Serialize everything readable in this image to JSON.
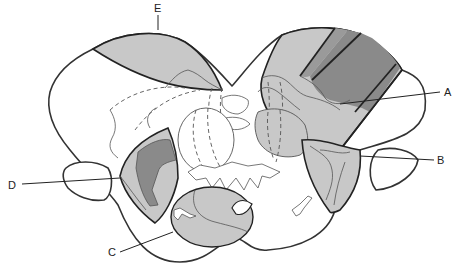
{
  "diagram": {
    "labels": [
      {
        "id": "A",
        "text": "A"
      },
      {
        "id": "B",
        "text": "B"
      },
      {
        "id": "C",
        "text": "C"
      },
      {
        "id": "D",
        "text": "D"
      },
      {
        "id": "E",
        "text": "E"
      }
    ],
    "colors": {
      "light_shade": "#c8c8c8",
      "mid_shade": "#a8a8a8",
      "dark_shade": "#8a8a8a",
      "outline": "#333333",
      "background": "#ffffff"
    }
  }
}
